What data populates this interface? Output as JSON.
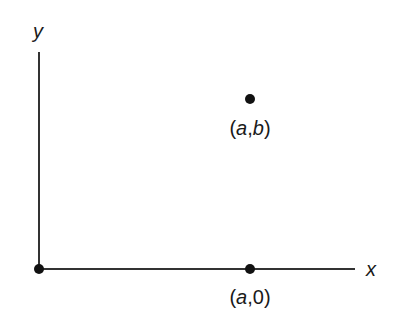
{
  "diagram": {
    "type": "coordinate-plane",
    "axes": {
      "x_label": "x",
      "y_label": "y"
    },
    "points": [
      {
        "id": "origin",
        "label": ""
      },
      {
        "id": "point-ab",
        "label_open": "(",
        "label_a": "a",
        "label_sep": ",",
        "label_b": "b",
        "label_close": ")"
      },
      {
        "id": "point-a0",
        "label_open": "(",
        "label_a": "a",
        "label_sep": ",",
        "label_b": "0",
        "label_close": ")"
      }
    ],
    "colors": {
      "ink": "#1a1a1a",
      "background": "#ffffff"
    }
  }
}
